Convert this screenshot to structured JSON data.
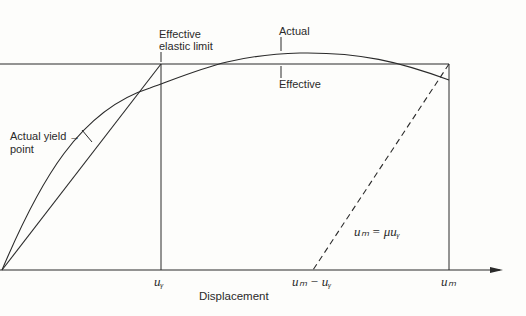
{
  "diagram": {
    "type": "force-displacement idealization",
    "labels": {
      "effective_elastic_limit_line1": "Effective",
      "effective_elastic_limit_line2": "elastic limit",
      "actual": "Actual",
      "effective": "Effective",
      "actual_yield_point_line1": "Actual yield →",
      "actual_yield_point_line2": "point",
      "equation": "uₘ = μuᵧ",
      "x_axis_label": "Displacement",
      "tick_uy": "uᵧ",
      "tick_um_minus_uy": "uₘ − uᵧ",
      "tick_um": "uₘ"
    },
    "colors": {
      "line": "#2a2a2a",
      "background": "#fdfdfb"
    }
  }
}
